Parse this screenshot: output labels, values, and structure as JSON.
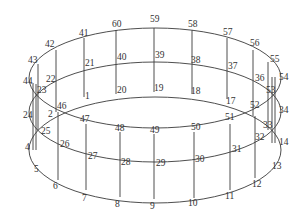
{
  "diagram": {
    "title": "",
    "type": "cylinder-wireframe-node-numbering",
    "rings": [
      {
        "name": "top",
        "center": [
          155,
          78
        ],
        "rx": 126,
        "ry": 50
      },
      {
        "name": "middle",
        "center": [
          155,
          112
        ],
        "rx": 126,
        "ry": 50
      },
      {
        "name": "bottom",
        "center": [
          155,
          150
        ],
        "rx": 126,
        "ry": 53
      }
    ],
    "nodes": [
      {
        "id": "1",
        "x": 84,
        "y": 97,
        "lx": 85,
        "ly": 99
      },
      {
        "id": "2",
        "x": 57,
        "y": 112,
        "lx": 48,
        "ly": 117
      },
      {
        "id": "4",
        "x": 33,
        "y": 150,
        "lx": 25,
        "ly": 150
      },
      {
        "id": "5",
        "x": 38,
        "y": 162,
        "lx": 34,
        "ly": 172
      },
      {
        "id": "6",
        "x": 58,
        "y": 180,
        "lx": 53,
        "ly": 189
      },
      {
        "id": "7",
        "x": 86,
        "y": 190,
        "lx": 82,
        "ly": 201
      },
      {
        "id": "8",
        "x": 120,
        "y": 197,
        "lx": 115,
        "ly": 207
      },
      {
        "id": "9",
        "x": 154,
        "y": 199,
        "lx": 150,
        "ly": 209
      },
      {
        "id": "10",
        "x": 194,
        "y": 198,
        "lx": 188,
        "ly": 206
      },
      {
        "id": "11",
        "x": 230,
        "y": 190,
        "lx": 225,
        "ly": 199
      },
      {
        "id": "12",
        "x": 255,
        "y": 178,
        "lx": 252,
        "ly": 187
      },
      {
        "id": "13",
        "x": 270,
        "y": 163,
        "lx": 272,
        "ly": 169
      },
      {
        "id": "14",
        "x": 272,
        "y": 143,
        "lx": 279,
        "ly": 145
      },
      {
        "id": "17",
        "x": 227,
        "y": 99,
        "lx": 226,
        "ly": 104
      },
      {
        "id": "18",
        "x": 192,
        "y": 94,
        "lx": 191,
        "ly": 94
      },
      {
        "id": "19",
        "x": 154,
        "y": 92,
        "lx": 154,
        "ly": 91
      },
      {
        "id": "20",
        "x": 116,
        "y": 94,
        "lx": 117,
        "ly": 93
      },
      {
        "id": "21",
        "x": 84,
        "y": 63,
        "lx": 85,
        "ly": 66
      },
      {
        "id": "22",
        "x": 56,
        "y": 73,
        "lx": 46,
        "ly": 82
      },
      {
        "id": "23",
        "x": 38,
        "y": 95,
        "lx": 37,
        "ly": 93
      },
      {
        "id": "24",
        "x": 33,
        "y": 114,
        "lx": 23,
        "ly": 118
      },
      {
        "id": "25",
        "x": 38,
        "y": 130,
        "lx": 41,
        "ly": 134
      },
      {
        "id": "26",
        "x": 58,
        "y": 145,
        "lx": 60,
        "ly": 147
      },
      {
        "id": "27",
        "x": 86,
        "y": 157,
        "lx": 88,
        "ly": 159
      },
      {
        "id": "28",
        "x": 120,
        "y": 165,
        "lx": 121,
        "ly": 165
      },
      {
        "id": "29",
        "x": 154,
        "y": 166,
        "lx": 156,
        "ly": 166
      },
      {
        "id": "30",
        "x": 194,
        "y": 164,
        "lx": 195,
        "ly": 162
      },
      {
        "id": "31",
        "x": 230,
        "y": 156,
        "lx": 232,
        "ly": 152
      },
      {
        "id": "32",
        "x": 255,
        "y": 142,
        "lx": 255,
        "ly": 140
      },
      {
        "id": "33",
        "x": 270,
        "y": 130,
        "lx": 263,
        "ly": 128
      },
      {
        "id": "34",
        "x": 274,
        "y": 110,
        "lx": 279,
        "ly": 113
      },
      {
        "id": "36",
        "x": 253,
        "y": 77,
        "lx": 255,
        "ly": 81
      },
      {
        "id": "37",
        "x": 227,
        "y": 69,
        "lx": 228,
        "ly": 69
      },
      {
        "id": "38",
        "x": 192,
        "y": 62,
        "lx": 191,
        "ly": 63
      },
      {
        "id": "39",
        "x": 154,
        "y": 59,
        "lx": 155,
        "ly": 58
      },
      {
        "id": "40",
        "x": 116,
        "y": 61,
        "lx": 117,
        "ly": 60
      },
      {
        "id": "41",
        "x": 84,
        "y": 38,
        "lx": 79,
        "ly": 36
      },
      {
        "id": "42",
        "x": 56,
        "y": 50,
        "lx": 45,
        "ly": 47
      },
      {
        "id": "43",
        "x": 38,
        "y": 64,
        "lx": 28,
        "ly": 63
      },
      {
        "id": "44",
        "x": 33,
        "y": 83,
        "lx": 23,
        "ly": 84
      },
      {
        "id": "46",
        "x": 57,
        "y": 112,
        "lx": 57,
        "ly": 109
      },
      {
        "id": "47",
        "x": 86,
        "y": 124,
        "lx": 80,
        "ly": 122
      },
      {
        "id": "48",
        "x": 120,
        "y": 132,
        "lx": 115,
        "ly": 131
      },
      {
        "id": "49",
        "x": 154,
        "y": 134,
        "lx": 150,
        "ly": 133
      },
      {
        "id": "50",
        "x": 194,
        "y": 132,
        "lx": 191,
        "ly": 130
      },
      {
        "id": "51",
        "x": 230,
        "y": 124,
        "lx": 225,
        "ly": 120
      },
      {
        "id": "52",
        "x": 252,
        "y": 110,
        "lx": 250,
        "ly": 108
      },
      {
        "id": "53",
        "x": 270,
        "y": 96,
        "lx": 266,
        "ly": 93
      },
      {
        "id": "54",
        "x": 276,
        "y": 77,
        "lx": 279,
        "ly": 80
      },
      {
        "id": "55",
        "x": 268,
        "y": 62,
        "lx": 270,
        "ly": 62
      },
      {
        "id": "56",
        "x": 253,
        "y": 50,
        "lx": 250,
        "ly": 46
      },
      {
        "id": "57",
        "x": 227,
        "y": 38,
        "lx": 223,
        "ly": 35
      },
      {
        "id": "58",
        "x": 192,
        "y": 30,
        "lx": 188,
        "ly": 27
      },
      {
        "id": "59",
        "x": 154,
        "y": 28,
        "lx": 150,
        "ly": 22
      },
      {
        "id": "60",
        "x": 116,
        "y": 30,
        "lx": 112,
        "ly": 27
      }
    ],
    "verticals": [
      [
        84,
        38,
        84,
        97
      ],
      [
        116,
        30,
        116,
        94
      ],
      [
        154,
        28,
        154,
        92
      ],
      [
        192,
        30,
        192,
        94
      ],
      [
        227,
        38,
        227,
        99
      ],
      [
        253,
        50,
        253,
        116
      ],
      [
        56,
        50,
        56,
        112
      ],
      [
        38,
        64,
        38,
        130
      ],
      [
        33,
        83,
        33,
        150
      ],
      [
        36,
        84,
        36,
        150
      ],
      [
        58,
        112,
        58,
        180
      ],
      [
        86,
        124,
        86,
        190
      ],
      [
        120,
        132,
        120,
        197
      ],
      [
        154,
        134,
        154,
        199
      ],
      [
        194,
        132,
        194,
        198
      ],
      [
        230,
        124,
        230,
        190
      ],
      [
        255,
        116,
        255,
        178
      ],
      [
        268,
        62,
        268,
        130
      ],
      [
        272,
        77,
        272,
        143
      ],
      [
        275,
        77,
        275,
        143
      ]
    ]
  }
}
